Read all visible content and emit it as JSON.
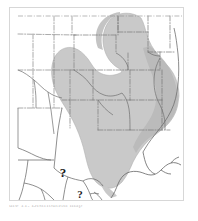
{
  "figure": {
    "kind": "distribution-range-map",
    "caption_partial": "ure 11. Distribution map",
    "frame_color": "#d7d7d7",
    "background_color": "#ffffff"
  },
  "map": {
    "region_label": "Central and Southeastern United States",
    "projection_note": "continental outline with state boundaries",
    "colors": {
      "range_fill": "#c9c9c9",
      "range_fill_dark": "#b5b5b5",
      "range_edge": "#b0b0b0",
      "coastline": "#6e6e6e",
      "state_boundary": "#7a7a7a",
      "country_boundary": "#5a5a5a",
      "land_fill": "#ffffff"
    },
    "legend_markers": [
      {
        "name": "uncertainty-marker-north",
        "symbol": "?",
        "meaning": "occurrence uncertain",
        "x": 62,
        "y": 172,
        "size": 11
      },
      {
        "name": "uncertainty-marker-south",
        "symbol": "?",
        "meaning": "occurrence uncertain",
        "x": 79,
        "y": 193,
        "size": 9
      }
    ],
    "shaded_range": {
      "description": "Continuous shaded distribution extending from the northern Great Plains south through the central plains to the Gulf Coast and east to the Atlantic seaboard",
      "northern_limit": "Dakotas / Minnesota",
      "western_limit": "eastern Colorado / New Mexico",
      "southern_limit": "Gulf Coast of Texas and Louisiana",
      "eastern_limit": "Carolinas / Virginia",
      "excluded_areas": "Florida peninsula, Great Lakes states, Northeast"
    }
  }
}
